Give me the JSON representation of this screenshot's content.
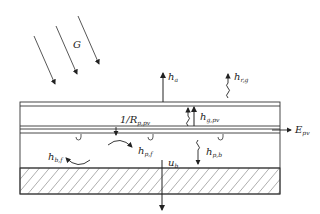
{
  "diagram": {
    "labels": {
      "irradiance": "G",
      "h_a": {
        "main": "h",
        "sub": "a"
      },
      "h_r_g": {
        "main": "h",
        "sub": "r,g"
      },
      "h_g_pv": {
        "main": "h",
        "sub": "g,pv"
      },
      "r_p_pv": {
        "main": "1/R",
        "sub": "p,pv"
      },
      "e_pv": {
        "main": "E",
        "sub": "pv"
      },
      "h_p_f": {
        "main": "h",
        "sub": "p,f"
      },
      "h_p_b": {
        "main": "h",
        "sub": "p,b"
      },
      "h_b_f": {
        "main": "h",
        "sub": "b,f"
      },
      "u_b": {
        "main": "u",
        "sub": "b"
      }
    },
    "layers": [
      "glass cover",
      "air gap",
      "PV layer",
      "fluid channel",
      "insulation"
    ],
    "stroke_color": "#333333"
  }
}
